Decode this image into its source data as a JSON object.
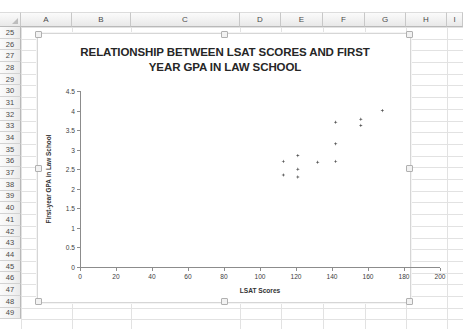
{
  "spreadsheet": {
    "columns": [
      "A",
      "B",
      "C",
      "D",
      "E",
      "F",
      "G",
      "H",
      "I"
    ],
    "rows": [
      "25",
      "26",
      "27",
      "28",
      "29",
      "30",
      "31",
      "32",
      "33",
      "34",
      "35",
      "36",
      "37",
      "38",
      "39",
      "40",
      "41",
      "42",
      "43",
      "44",
      "45",
      "46",
      "47",
      "48",
      "49"
    ],
    "corner_label": ""
  },
  "chart_data": {
    "type": "scatter",
    "title": "RELATIONSHIP BETWEEN LSAT SCORES AND FIRST YEAR GPA IN LAW SCHOOL",
    "title_line1": "RELATIONSHIP BETWEEN LSAT SCORES AND FIRST",
    "title_line2": "YEAR GPA IN LAW SCHOOL",
    "xlabel": "LSAT Scores",
    "ylabel": "First-year GPA in Law School",
    "xlim": [
      0,
      200
    ],
    "ylim": [
      0,
      4.5
    ],
    "xticks": [
      0,
      20,
      40,
      60,
      80,
      100,
      120,
      140,
      160,
      180,
      200
    ],
    "xtick_labels": [
      "0",
      "20",
      "40",
      "60",
      "80",
      "100",
      "120",
      "140",
      "160",
      "180",
      "200"
    ],
    "yticks": [
      0,
      0.5,
      1,
      1.5,
      2,
      2.5,
      3,
      3.5,
      4,
      4.5
    ],
    "ytick_labels": [
      "0",
      "0.5",
      "1",
      "1.5",
      "2",
      "2.5",
      "3",
      "3.5",
      "4",
      "4.5"
    ],
    "grid": false,
    "legend": false,
    "marker": "diamond",
    "marker_color": "#595959",
    "points": [
      {
        "x": 113,
        "y": 2.7
      },
      {
        "x": 113,
        "y": 2.35
      },
      {
        "x": 121,
        "y": 2.85
      },
      {
        "x": 121,
        "y": 2.5
      },
      {
        "x": 121,
        "y": 2.3
      },
      {
        "x": 132,
        "y": 2.68
      },
      {
        "x": 142,
        "y": 2.7
      },
      {
        "x": 142,
        "y": 3.15
      },
      {
        "x": 142,
        "y": 3.7
      },
      {
        "x": 156,
        "y": 3.78
      },
      {
        "x": 156,
        "y": 3.62
      },
      {
        "x": 168,
        "y": 4.0
      }
    ]
  },
  "colors": {
    "marker": "#595959",
    "axis": "#8c8c8c",
    "grid": "#e2e2e2",
    "chart_border": "#d6d6d6",
    "header_text": "#4a4a4a"
  }
}
